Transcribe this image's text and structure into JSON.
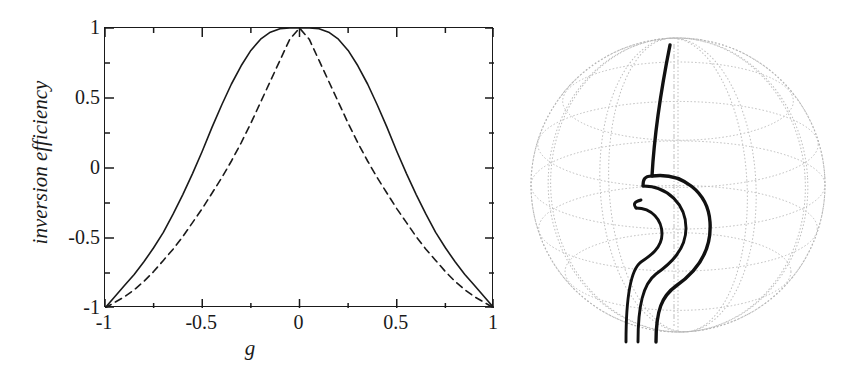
{
  "figure": {
    "caption_text": "",
    "background_color": "#ffffff",
    "ink_color": "#1a1a1a",
    "grid_color": "#b8b8b8"
  },
  "chart_data": {
    "type": "line",
    "title": "",
    "subtitle": "",
    "xlabel": "g",
    "ylabel": "inversion efficiency",
    "xlim": [
      -1,
      1
    ],
    "ylim": [
      -1,
      1
    ],
    "grid": false,
    "legend": null,
    "legend_position": "none",
    "x_ticks": [
      -1,
      -0.5,
      0,
      0.5,
      1
    ],
    "x_tick_labels": [
      "-1",
      "-0.5",
      "0",
      "0.5",
      "1"
    ],
    "x_minor_ticks": [
      -0.75,
      -0.25,
      0.25,
      0.75
    ],
    "y_ticks": [
      -1,
      -0.5,
      0,
      0.5,
      1
    ],
    "y_tick_labels": [
      "-1",
      "-0.5",
      "0",
      "0.5",
      "1"
    ],
    "y_minor_ticks": [
      -0.75,
      -0.25,
      0.25,
      0.75
    ],
    "series": [
      {
        "name": "solid",
        "style": "solid",
        "color": "#1a1a1a",
        "x": [
          -1.0,
          -0.95,
          -0.9,
          -0.85,
          -0.8,
          -0.75,
          -0.7,
          -0.65,
          -0.6,
          -0.55,
          -0.5,
          -0.45,
          -0.4,
          -0.35,
          -0.3,
          -0.25,
          -0.2,
          -0.15,
          -0.1,
          -0.05,
          0.0,
          0.05,
          0.1,
          0.15,
          0.2,
          0.25,
          0.3,
          0.35,
          0.4,
          0.45,
          0.5,
          0.55,
          0.6,
          0.65,
          0.7,
          0.75,
          0.8,
          0.85,
          0.9,
          0.95,
          1.0
        ],
        "y": [
          -1.0,
          -0.92,
          -0.84,
          -0.76,
          -0.67,
          -0.57,
          -0.46,
          -0.33,
          -0.19,
          -0.04,
          0.12,
          0.29,
          0.45,
          0.6,
          0.73,
          0.84,
          0.92,
          0.97,
          0.995,
          1.0,
          1.0,
          1.0,
          0.995,
          0.97,
          0.92,
          0.84,
          0.73,
          0.6,
          0.45,
          0.29,
          0.12,
          -0.04,
          -0.19,
          -0.33,
          -0.46,
          -0.57,
          -0.67,
          -0.76,
          -0.84,
          -0.92,
          -1.0
        ]
      },
      {
        "name": "dashed",
        "style": "dashed",
        "color": "#1a1a1a",
        "x": [
          -1.0,
          -0.95,
          -0.9,
          -0.85,
          -0.8,
          -0.75,
          -0.7,
          -0.65,
          -0.6,
          -0.55,
          -0.5,
          -0.45,
          -0.4,
          -0.35,
          -0.3,
          -0.25,
          -0.2,
          -0.15,
          -0.1,
          -0.05,
          0.0,
          0.05,
          0.1,
          0.15,
          0.2,
          0.25,
          0.3,
          0.35,
          0.4,
          0.45,
          0.5,
          0.55,
          0.6,
          0.65,
          0.7,
          0.75,
          0.8,
          0.85,
          0.9,
          0.95,
          1.0
        ],
        "y": [
          -1.0,
          -0.96,
          -0.92,
          -0.87,
          -0.81,
          -0.74,
          -0.66,
          -0.58,
          -0.49,
          -0.39,
          -0.29,
          -0.18,
          -0.07,
          0.05,
          0.18,
          0.32,
          0.47,
          0.62,
          0.77,
          0.92,
          1.0,
          0.92,
          0.77,
          0.62,
          0.47,
          0.32,
          0.18,
          0.05,
          -0.07,
          -0.18,
          -0.29,
          -0.39,
          -0.49,
          -0.58,
          -0.66,
          -0.74,
          -0.81,
          -0.87,
          -0.92,
          -0.96,
          -1.0
        ]
      }
    ]
  },
  "sphere": {
    "name": "bloch-sphere",
    "outline_color": "#b5b5b5",
    "grid_color": "#bdbdbd",
    "trajectory_color": "#111111",
    "center_x": 168,
    "center_y": 185,
    "radius": 147,
    "latitudes": 4,
    "longitudes": 4,
    "trajectory_label": "spin trajectory",
    "trajectory_turns": 3
  }
}
